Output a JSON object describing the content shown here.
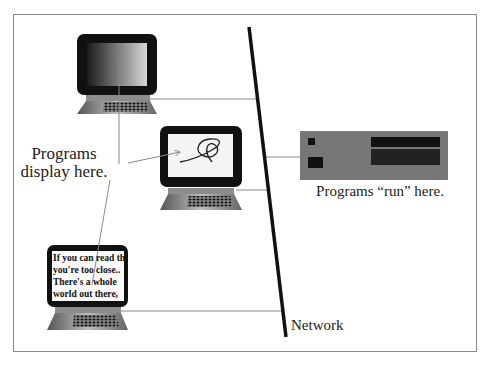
{
  "diagram": {
    "type": "client-server network illustration",
    "labels": {
      "clients": [
        "Programs",
        "display here."
      ],
      "server": "Programs “run” here.",
      "network": "Network"
    },
    "clients": [
      {
        "id": "laptop-top",
        "screen": "gradient"
      },
      {
        "id": "laptop-middle",
        "screen": "scribble"
      },
      {
        "id": "laptop-bottom",
        "screen": "text",
        "screen_text": [
          "If you can read this,",
          "you're too close..",
          "There's a whole",
          "world out there,"
        ]
      }
    ],
    "server": {
      "id": "server-box"
    },
    "colors": {
      "monitor": "#111111",
      "server": "#777777",
      "network_line": "#111111",
      "connector": "#8a8a8a",
      "frame": "#8a8a8a"
    }
  }
}
